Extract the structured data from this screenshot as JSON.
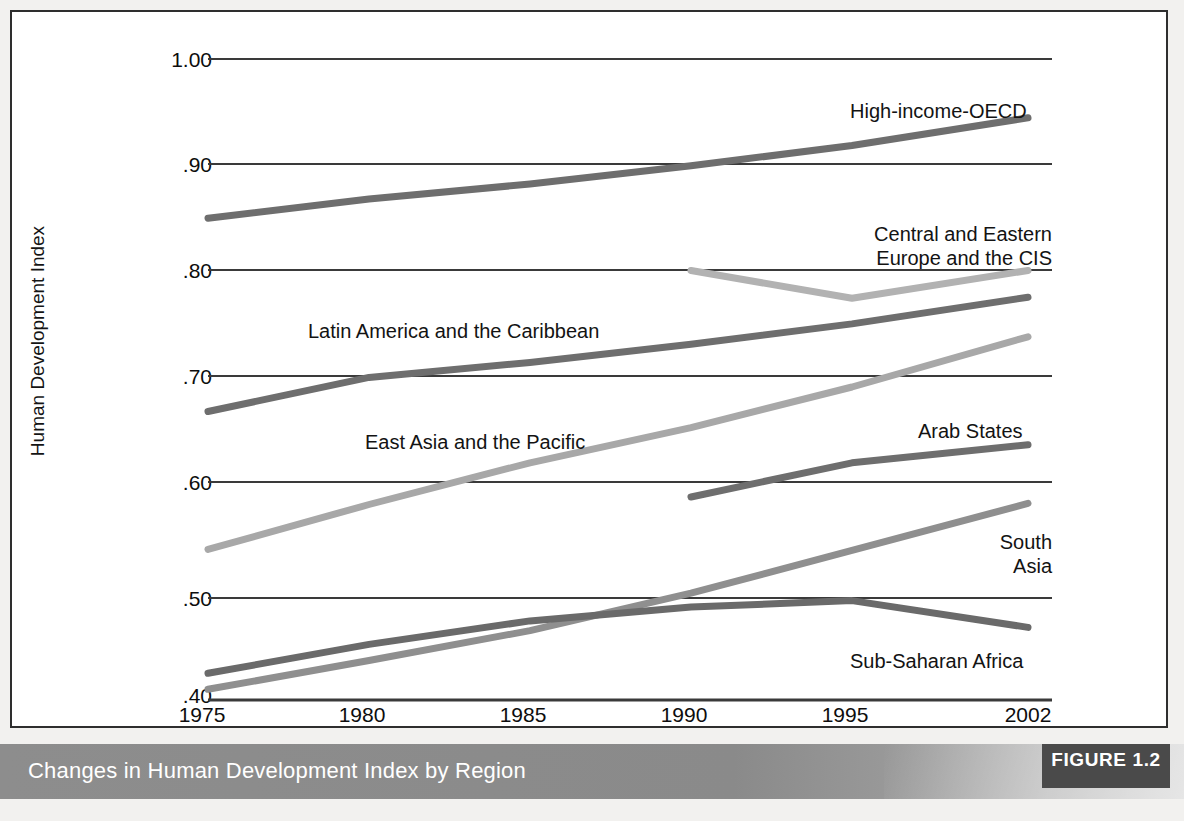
{
  "figure": {
    "caption": "Changes in Human Development Index by Region",
    "badge_label": "FIGURE 1.2"
  },
  "chart_data": {
    "type": "line",
    "title": "Changes in Human Development Index by Region",
    "xlabel": "",
    "ylabel": "Human Development Index",
    "x": [
      1975,
      1980,
      1985,
      1990,
      1995,
      2002
    ],
    "xtick_labels": [
      "1975",
      "1980",
      "1985",
      "1990",
      "1995",
      "2002"
    ],
    "ytick_labels": [
      "1.00",
      ".90",
      ".80",
      ".70",
      ".60",
      ".50",
      ".40"
    ],
    "yticks": [
      1.0,
      0.9,
      0.8,
      0.7,
      0.6,
      0.5,
      0.4
    ],
    "ylim": [
      0.4,
      1.0
    ],
    "grid": "horizontal",
    "legend": "inline-labels",
    "series": [
      {
        "name": "High-income-OECD",
        "color": "#6e6e6e",
        "x": [
          1975,
          1980,
          1985,
          1990,
          1995,
          2002
        ],
        "values": [
          0.851,
          0.869,
          0.883,
          0.9,
          0.919,
          0.945
        ]
      },
      {
        "name": "Central and Eastern Europe and the CIS",
        "color": "#b2b2b2",
        "x": [
          1990,
          1995,
          2002
        ],
        "values": [
          0.802,
          0.776,
          0.802
        ]
      },
      {
        "name": "Latin America and the Caribbean",
        "color": "#6e6e6e",
        "x": [
          1975,
          1980,
          1985,
          1990,
          1995,
          2002
        ],
        "values": [
          0.67,
          0.702,
          0.716,
          0.733,
          0.752,
          0.777
        ]
      },
      {
        "name": "East Asia and the Pacific",
        "color": "#a8a8a8",
        "x": [
          1975,
          1980,
          1985,
          1990,
          1995,
          2002
        ],
        "values": [
          0.541,
          0.583,
          0.622,
          0.655,
          0.693,
          0.74
        ]
      },
      {
        "name": "Arab States",
        "color": "#6e6e6e",
        "x": [
          1990,
          1995,
          2002
        ],
        "values": [
          0.59,
          0.622,
          0.639
        ]
      },
      {
        "name": "South Asia",
        "color": "#8f8f8f",
        "x": [
          1975,
          1980,
          1985,
          1990,
          1995,
          2002
        ],
        "values": [
          0.41,
          0.437,
          0.465,
          0.5,
          0.54,
          0.584
        ]
      },
      {
        "name": "Sub-Saharan Africa",
        "color": "#6a6a6a",
        "x": [
          1975,
          1980,
          1985,
          1990,
          1995,
          2002
        ],
        "values": [
          0.425,
          0.452,
          0.474,
          0.487,
          0.493,
          0.468
        ]
      }
    ],
    "annotations": [
      {
        "text": "High-income-OECD",
        "series": "High-income-OECD"
      },
      {
        "text": "Central and Eastern\nEurope and the CIS",
        "series": "Central and Eastern Europe and the CIS"
      },
      {
        "text": "Latin America and the Caribbean",
        "series": "Latin America and the Caribbean"
      },
      {
        "text": "East Asia and the Pacific",
        "series": "East Asia and the Pacific"
      },
      {
        "text": "Arab States",
        "series": "Arab States"
      },
      {
        "text": "South Asia",
        "series": "South Asia"
      },
      {
        "text": "Sub-Saharan Africa",
        "series": "Sub-Saharan Africa"
      }
    ]
  },
  "labels": {
    "y_axis_title": "Human Development Index",
    "oecd": "High-income-OECD",
    "cee_line1": "Central and Eastern",
    "cee_line2": "Europe and the CIS",
    "latam": "Latin America and the Caribbean",
    "eap": "East Asia and the Pacific",
    "arab": "Arab States",
    "south_asia_line1": "South",
    "south_asia_line2": "Asia",
    "ssa": "Sub-Saharan Africa"
  },
  "yticks": [
    "1.00",
    ".90",
    ".80",
    ".70",
    ".60",
    ".50",
    ".40"
  ],
  "xticks": [
    "1975",
    "1980",
    "1985",
    "1990",
    "1995",
    "2002"
  ]
}
